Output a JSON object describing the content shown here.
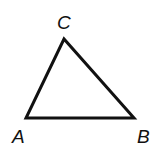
{
  "diagram": {
    "type": "triangle",
    "vertices": [
      {
        "label": "A",
        "x": 26,
        "y": 118,
        "label_x": 12,
        "label_y": 143
      },
      {
        "label": "B",
        "x": 134,
        "y": 118,
        "label_x": 137,
        "label_y": 143
      },
      {
        "label": "C",
        "x": 64,
        "y": 39,
        "label_x": 57,
        "label_y": 29
      }
    ],
    "stroke_color": "#111111",
    "background": "#ffffff"
  }
}
